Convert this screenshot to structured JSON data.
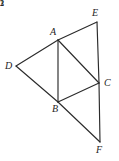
{
  "figure": {
    "background_color": "#ffffff",
    "stroke_color": "#2b2b2b",
    "label_color": "#1d1d1d",
    "width": 119,
    "height": 161,
    "vertices": [
      {
        "id": "D",
        "label": "D",
        "x": 16,
        "y": 66,
        "label_x": 5,
        "label_y": 61
      },
      {
        "id": "A",
        "label": "A",
        "x": 58,
        "y": 40,
        "label_x": 50,
        "label_y": 27
      },
      {
        "id": "E",
        "label": "E",
        "x": 97,
        "y": 22,
        "label_x": 92,
        "label_y": 8
      },
      {
        "id": "B",
        "label": "B",
        "x": 58,
        "y": 102,
        "label_x": 52,
        "label_y": 104
      },
      {
        "id": "C",
        "label": "C",
        "x": 99,
        "y": 83,
        "label_x": 104,
        "label_y": 78
      },
      {
        "id": "F",
        "label": "F",
        "x": 100,
        "y": 142,
        "label_x": 96,
        "label_y": 145
      }
    ],
    "edges": [
      {
        "id": "DA",
        "from": "D",
        "to": "A",
        "x1": 16,
        "y1": 66,
        "x2": 58,
        "y2": 40
      },
      {
        "id": "DB",
        "from": "D",
        "to": "B",
        "x1": 16,
        "y1": 66,
        "x2": 58,
        "y2": 102
      },
      {
        "id": "AB",
        "from": "A",
        "to": "B",
        "x1": 58,
        "y1": 40,
        "x2": 58,
        "y2": 102
      },
      {
        "id": "AE",
        "from": "A",
        "to": "E",
        "x1": 58,
        "y1": 40,
        "x2": 97,
        "y2": 22
      },
      {
        "id": "EC",
        "from": "E",
        "to": "C",
        "x1": 97,
        "y1": 22,
        "x2": 99,
        "y2": 83
      },
      {
        "id": "AC",
        "from": "A",
        "to": "C",
        "x1": 58,
        "y1": 40,
        "x2": 99,
        "y2": 83
      },
      {
        "id": "BC",
        "from": "B",
        "to": "C",
        "x1": 58,
        "y1": 102,
        "x2": 99,
        "y2": 83
      },
      {
        "id": "BF",
        "from": "B",
        "to": "F",
        "x1": 58,
        "y1": 102,
        "x2": 100,
        "y2": 142
      },
      {
        "id": "CF",
        "from": "C",
        "to": "F",
        "x1": 99,
        "y1": 83,
        "x2": 100,
        "y2": 142
      }
    ],
    "angle_labels": [
      {
        "id": "angle-1",
        "label": "1",
        "x": 62,
        "y": 49,
        "at_vertex": "A"
      },
      {
        "id": "angle-2",
        "label": "2",
        "x": 61,
        "y": 87,
        "at_vertex": "B"
      },
      {
        "id": "angle-3",
        "label": "3",
        "x": 86,
        "y": 75,
        "at_vertex": "C"
      }
    ]
  }
}
